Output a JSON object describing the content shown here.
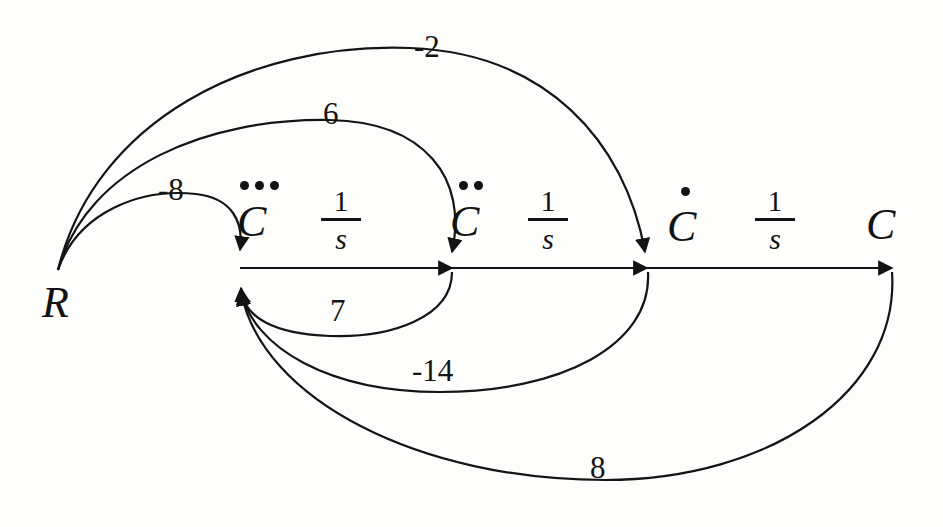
{
  "diagram": {
    "stroke_color": "#141414",
    "background_color": "#fdfdfb",
    "nodes": [
      {
        "id": "R",
        "label": "R",
        "dots": 0,
        "x": 58,
        "y": 270
      },
      {
        "id": "C3",
        "label": "C",
        "dots": 3,
        "x": 240,
        "y": 267
      },
      {
        "id": "C2",
        "label": "C",
        "dots": 2,
        "x": 450,
        "y": 267
      },
      {
        "id": "C1",
        "label": "C",
        "dots": 1,
        "x": 645,
        "y": 267
      },
      {
        "id": "C0",
        "label": "C",
        "dots": 0,
        "x": 890,
        "y": 267
      }
    ],
    "forward_gains": [
      {
        "numerator": "1",
        "denominator": "s",
        "from": "C3",
        "to": "C2"
      },
      {
        "numerator": "1",
        "denominator": "s",
        "from": "C2",
        "to": "C1"
      },
      {
        "numerator": "1",
        "denominator": "s",
        "from": "C1",
        "to": "C0"
      }
    ],
    "input_branches": [
      {
        "label": "-8",
        "from": "R",
        "to": "C3"
      },
      {
        "label": "6",
        "from": "R",
        "to": "C2"
      },
      {
        "label": "-2",
        "from": "R",
        "to": "C1"
      }
    ],
    "feedback_branches": [
      {
        "label": "7",
        "from": "C2",
        "to": "C3"
      },
      {
        "label": "-14",
        "from": "C1",
        "to": "C3"
      },
      {
        "label": "8",
        "from": "C0",
        "to": "C3"
      }
    ]
  }
}
